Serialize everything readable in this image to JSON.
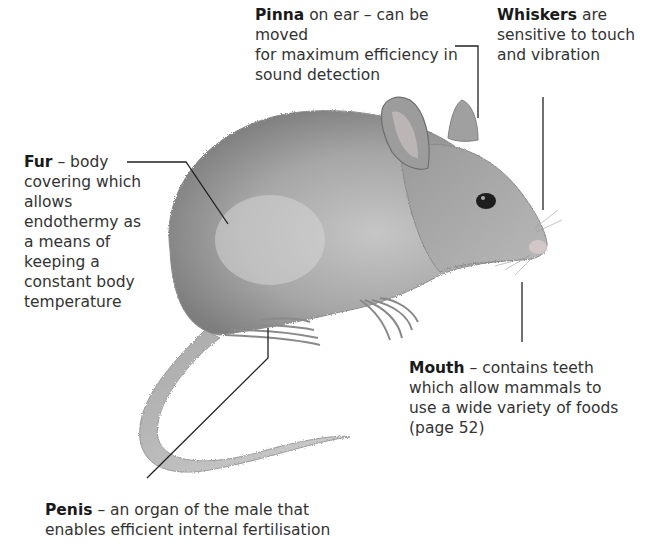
{
  "diagram": {
    "labels": {
      "pinna": {
        "term": "Pinna",
        "lines": [
          " on ear – can be moved",
          "for maximum efficiency in",
          "sound detection"
        ]
      },
      "whiskers": {
        "term": "Whiskers",
        "lines": [
          " are",
          "sensitive to touch",
          "and vibration"
        ]
      },
      "fur": {
        "term": "Fur",
        "lines": [
          " – body",
          "covering which",
          "allows",
          "endothermy as",
          "a means of",
          "keeping a",
          "constant body",
          "temperature"
        ]
      },
      "mouth": {
        "term": "Mouth",
        "lines": [
          " – contains teeth",
          "which allow mammals to",
          "use a wide variety of foods",
          "(page 52)"
        ]
      },
      "penis": {
        "term": "Penis",
        "lines": [
          " – an organ of the male that",
          "enables efficient internal fertilisation"
        ]
      }
    },
    "colors": {
      "background": "#ffffff",
      "text": "#333333",
      "leader_line": "#222222",
      "fur_dark": "#8a8a8a",
      "fur_light": "#c9c9c9"
    }
  }
}
